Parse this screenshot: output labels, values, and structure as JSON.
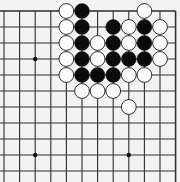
{
  "board": {
    "description": "Go board fragment, upper-right corner region (top edge and right edge visible)",
    "background": "#f3f3f3",
    "line_color": "#2e2e2e",
    "columns": 12,
    "rows": 11,
    "origin_x": 4,
    "origin_y": 11,
    "spacing_x": 15.6,
    "spacing_y": 16,
    "edges": [
      "top",
      "right"
    ],
    "star_points": [
      {
        "col": 2,
        "row": 3
      },
      {
        "col": 2,
        "row": 9
      },
      {
        "col": 8,
        "row": 9
      }
    ],
    "stones": [
      {
        "color": "white",
        "col": 4,
        "row": 0
      },
      {
        "color": "black",
        "col": 5,
        "row": 0
      },
      {
        "color": "white",
        "col": 9,
        "row": 0
      },
      {
        "color": "white",
        "col": 4,
        "row": 1
      },
      {
        "color": "black",
        "col": 5,
        "row": 1
      },
      {
        "color": "black",
        "col": 7,
        "row": 1
      },
      {
        "color": "white",
        "col": 8,
        "row": 1
      },
      {
        "color": "black",
        "col": 9,
        "row": 1
      },
      {
        "color": "white",
        "col": 10,
        "row": 1
      },
      {
        "color": "white",
        "col": 4,
        "row": 2
      },
      {
        "color": "black",
        "col": 5,
        "row": 2
      },
      {
        "color": "white",
        "col": 6,
        "row": 2
      },
      {
        "color": "black",
        "col": 7,
        "row": 2
      },
      {
        "color": "white",
        "col": 8,
        "row": 2
      },
      {
        "color": "black",
        "col": 9,
        "row": 2
      },
      {
        "color": "white",
        "col": 10,
        "row": 2
      },
      {
        "color": "white",
        "col": 4,
        "row": 3
      },
      {
        "color": "black",
        "col": 5,
        "row": 3
      },
      {
        "color": "white",
        "col": 6,
        "row": 3
      },
      {
        "color": "black",
        "col": 7,
        "row": 3
      },
      {
        "color": "black",
        "col": 8,
        "row": 3
      },
      {
        "color": "black",
        "col": 9,
        "row": 3
      },
      {
        "color": "white",
        "col": 10,
        "row": 3
      },
      {
        "color": "white",
        "col": 4,
        "row": 4
      },
      {
        "color": "black",
        "col": 5,
        "row": 4
      },
      {
        "color": "black",
        "col": 6,
        "row": 4
      },
      {
        "color": "black",
        "col": 7,
        "row": 4
      },
      {
        "color": "white",
        "col": 8,
        "row": 4
      },
      {
        "color": "white",
        "col": 9,
        "row": 4
      },
      {
        "color": "white",
        "col": 5,
        "row": 5
      },
      {
        "color": "white",
        "col": 6,
        "row": 5
      },
      {
        "color": "white",
        "col": 7,
        "row": 5
      },
      {
        "color": "white",
        "col": 8,
        "row": 6
      }
    ]
  }
}
